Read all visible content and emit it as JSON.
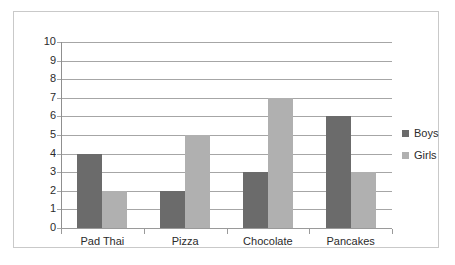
{
  "chart_data": {
    "type": "bar",
    "title": "",
    "subtitle": "",
    "xlabel": "",
    "ylabel": "",
    "categories": [
      "Pad Thai",
      "Pizza",
      "Chocolate",
      "Pancakes"
    ],
    "series": [
      {
        "name": "Boys",
        "values": [
          4,
          2,
          3,
          6
        ],
        "color": "#6b6b6b"
      },
      {
        "name": "Girls",
        "values": [
          2,
          5,
          7,
          3
        ],
        "color": "#b0b0b0"
      }
    ],
    "ylim": [
      0,
      10
    ],
    "ytick_step": 1,
    "ytick_labels": [
      "10",
      "9",
      "8",
      "7",
      "6",
      "5",
      "4",
      "3",
      "2",
      "1",
      "0"
    ],
    "grid": true,
    "grid_axis": "y",
    "legend_position": "right",
    "legend_entries": [
      "Boys",
      "Girls"
    ],
    "annotations": [],
    "frame_border_color": "#c9c9c9",
    "background_color": "#ffffff",
    "gridline_color": "#a6a6a6",
    "axis_color": "#9a9a9a"
  }
}
